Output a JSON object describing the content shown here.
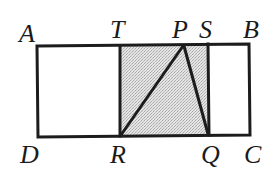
{
  "diagram": {
    "type": "geometry",
    "colors": {
      "stroke": "#1c1c1c",
      "shade": "#d9d9d9",
      "background": "#ffffff"
    },
    "points": {
      "A": {
        "label": "A",
        "x": 37,
        "y": 46
      },
      "B": {
        "label": "B",
        "x": 249,
        "y": 44
      },
      "C": {
        "label": "C",
        "x": 250,
        "y": 135
      },
      "D": {
        "label": "D",
        "x": 38,
        "y": 137
      },
      "T": {
        "label": "T",
        "x": 120,
        "y": 46
      },
      "P": {
        "label": "P",
        "x": 183,
        "y": 45
      },
      "S": {
        "label": "S",
        "x": 208,
        "y": 44
      },
      "R": {
        "label": "R",
        "x": 120,
        "y": 136
      },
      "Q": {
        "label": "Q",
        "x": 209,
        "y": 135
      }
    },
    "labels": [
      {
        "id": "A",
        "text": "A",
        "x": 19,
        "y": 42
      },
      {
        "id": "T",
        "text": "T",
        "x": 110,
        "y": 38
      },
      {
        "id": "P",
        "text": "P",
        "x": 172,
        "y": 38
      },
      {
        "id": "S",
        "text": "S",
        "x": 199,
        "y": 38
      },
      {
        "id": "B",
        "text": "B",
        "x": 243,
        "y": 38
      },
      {
        "id": "D",
        "text": "D",
        "x": 20,
        "y": 163
      },
      {
        "id": "R",
        "text": "R",
        "x": 110,
        "y": 163
      },
      {
        "id": "Q",
        "text": "Q",
        "x": 201,
        "y": 163
      },
      {
        "id": "C",
        "text": "C",
        "x": 244,
        "y": 163
      }
    ],
    "shapes": {
      "outer_rectangle": [
        "A",
        "B",
        "C",
        "D"
      ],
      "shaded_rectangle": [
        "T",
        "S",
        "Q",
        "R"
      ],
      "segments": [
        [
          "P",
          "R"
        ],
        [
          "P",
          "Q"
        ],
        [
          "T",
          "R"
        ],
        [
          "S",
          "Q"
        ]
      ]
    }
  }
}
